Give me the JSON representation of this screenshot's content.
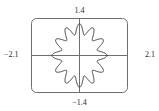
{
  "figure": {
    "kind": "graphing-calculator-viewing-window",
    "frame_color": "#6e6e6e",
    "axis_color": "#6e6e6e",
    "curve_color": "#3a3a3a",
    "background": "#ffffff"
  },
  "labels": {
    "top": "1.4",
    "bottom": "−1.4",
    "left": "−2.1",
    "right": "2.1"
  },
  "chart_data": {
    "type": "line",
    "title": "",
    "subtitle": "",
    "xlabel": "",
    "ylabel": "",
    "xlim": [
      -2.1,
      2.1
    ],
    "ylim": [
      -1.4,
      1.4
    ],
    "xticks": [
      -2.1,
      2.1
    ],
    "xticklabels": [
      "−2.1",
      "2.1"
    ],
    "yticks": [
      -1.4,
      1.4
    ],
    "yticklabels": [
      "−1.4",
      "1.4"
    ],
    "grid": false,
    "legend": null,
    "legend_position": "none",
    "annotations": [
      {
        "text": "1.4",
        "position": "top-center"
      },
      {
        "text": "−1.4",
        "position": "bottom-center"
      },
      {
        "text": "−2.1",
        "position": "left-middle"
      },
      {
        "text": "2.1",
        "position": "right-middle"
      }
    ],
    "series": [
      {
        "name": "polar-rose",
        "coordinate_system": "polar",
        "equation": "r = 1 + 0.2 cos(12θ)",
        "petals": 12,
        "r_min": 0.8,
        "r_max": 1.2,
        "theta_range": [
          0,
          6.283185307179586
        ],
        "closed": true,
        "x": [
          1.2,
          1.192,
          1.169,
          1.132,
          1.083,
          1.025,
          0.963,
          0.901,
          0.844,
          0.797,
          0.763,
          0.745,
          0.744,
          0.758,
          0.787,
          0.826,
          0.872,
          0.919,
          0.962,
          0.997,
          1.018,
          1.024,
          1.013,
          0.985,
          0.942,
          0.886,
          0.82,
          0.748,
          0.674,
          0.602,
          0.535,
          0.477,
          0.43,
          0.396,
          0.375,
          0.367,
          0.371,
          0.385,
          0.406,
          0.432,
          0.459,
          0.484,
          0.502,
          0.512,
          0.512,
          0.5,
          0.476,
          0.44,
          0.393,
          0.336,
          0.272,
          0.203,
          0.131,
          0.06,
          -0.009,
          -0.074,
          -0.131,
          -0.18,
          -0.219,
          -0.247,
          -0.265,
          -0.273,
          -0.272,
          -0.264,
          -0.251,
          -0.236,
          -0.221,
          -0.21,
          -0.204,
          -0.206,
          -0.218,
          -0.24,
          -0.274,
          -0.32,
          -0.377,
          -0.443,
          -0.516,
          -0.594,
          -0.673,
          -0.75,
          -0.822,
          -0.885,
          -0.937,
          -0.975,
          -0.998,
          -1.005,
          -0.996,
          -0.974,
          -0.939,
          -0.895,
          -0.845,
          -0.793,
          -0.743,
          -0.699,
          -0.665,
          -0.644,
          -0.639,
          -0.652,
          -0.683,
          -0.733,
          -0.8,
          -0.881,
          -0.974,
          -1.073,
          -1.175,
          -1.273,
          -1.364,
          -1.441,
          -1.501,
          -1.54,
          -1.556,
          -1.547,
          -1.514,
          -1.459,
          -1.386,
          -1.298,
          -1.2
        ],
        "y": [
          0.0,
          0.117,
          0.231,
          0.339,
          0.438,
          0.525,
          0.598,
          0.655,
          0.696,
          0.72,
          0.728,
          0.721,
          0.702,
          0.673,
          0.636,
          0.595,
          0.552,
          0.51,
          0.471,
          0.437,
          0.41,
          0.39,
          0.378,
          0.373,
          0.375,
          0.383,
          0.394,
          0.408,
          0.422,
          0.435,
          0.444,
          0.449,
          0.448,
          0.441,
          0.428,
          0.409,
          0.385,
          0.357,
          0.327,
          0.296,
          0.266,
          0.239,
          0.216,
          0.199,
          0.189,
          0.186,
          0.191,
          0.204,
          0.224,
          0.25,
          0.281,
          0.315,
          0.35,
          0.385,
          0.416,
          0.442,
          0.461,
          0.472,
          0.474,
          0.467,
          0.451,
          0.426,
          0.394,
          0.356,
          0.313,
          0.268,
          0.222,
          0.177,
          0.135,
          0.097,
          0.064,
          0.037,
          0.017,
          0.004,
          -0.003,
          -0.003,
          0.003,
          0.015,
          0.031,
          0.05,
          0.071,
          0.092,
          0.111,
          0.127,
          0.138,
          0.143,
          0.141,
          0.132,
          0.114,
          0.089,
          0.057,
          0.018,
          -0.025,
          -0.073,
          -0.124,
          -0.176,
          -0.228,
          -0.279,
          -0.327,
          -0.371,
          -0.409,
          -0.44,
          -0.463,
          -0.478,
          -0.483,
          -0.479,
          -0.465,
          -0.442,
          -0.411,
          -0.372,
          -0.327,
          -0.276,
          -0.222,
          -0.166,
          -0.109,
          -0.053,
          0.0
        ]
      }
    ]
  }
}
